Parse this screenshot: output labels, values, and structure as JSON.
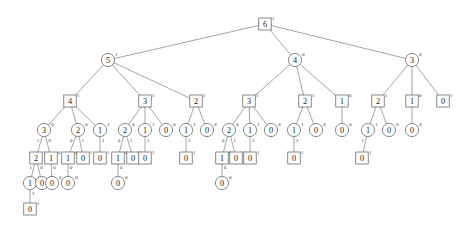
{
  "header": {
    "watermark": ""
  },
  "diagram": {
    "type": "tree",
    "shapes": {
      "square": "square-node",
      "circle": "circle-node"
    },
    "colors": {
      "stroke": "#4a4a4a",
      "fill": "#ffffff",
      "text": "#1a1a1a",
      "background": "#ffffff"
    },
    "levels": [
      {
        "index": 0,
        "shape": "square",
        "y": 24
      },
      {
        "index": 1,
        "shape": "circle",
        "y": 60
      },
      {
        "index": 2,
        "shape": "square",
        "y": 101
      },
      {
        "index": 3,
        "shape": "circle",
        "y": 130
      },
      {
        "index": 4,
        "shape": "square",
        "y": 158
      },
      {
        "index": 5,
        "shape": "circle",
        "y": 183
      },
      {
        "index": 6,
        "shape": "square",
        "y": 209
      }
    ],
    "nodes": [
      {
        "id": "n0",
        "level": 0,
        "shape": "square",
        "value": "6",
        "sup": "1",
        "x": 265,
        "y": 24
      },
      {
        "id": "n1",
        "level": 1,
        "shape": "circle",
        "value": "5",
        "sup": "1",
        "x": 108,
        "y": 60
      },
      {
        "id": "n2",
        "level": 1,
        "shape": "circle",
        "value": "4",
        "sup": "0",
        "x": 295,
        "y": 60
      },
      {
        "id": "n3",
        "level": 1,
        "shape": "circle",
        "value": "3",
        "sup": "0",
        "x": 412,
        "y": 60
      },
      {
        "id": "n4",
        "level": 2,
        "shape": "square",
        "value": "4",
        "sup": "1",
        "x": 70,
        "y": 101
      },
      {
        "id": "n5",
        "level": 2,
        "shape": "square",
        "value": "3",
        "sup": "1",
        "x": 145,
        "y": 101
      },
      {
        "id": "n6",
        "level": 2,
        "shape": "square",
        "value": "2",
        "sup": "1",
        "x": 196,
        "y": 101
      },
      {
        "id": "n7",
        "level": 2,
        "shape": "square",
        "value": "3",
        "sup": "1",
        "x": 249,
        "y": 101
      },
      {
        "id": "n8",
        "level": 2,
        "shape": "square",
        "value": "2",
        "sup": "1",
        "x": 305,
        "y": 101
      },
      {
        "id": "n9",
        "level": 2,
        "shape": "square",
        "value": "1",
        "sup": "0",
        "x": 342,
        "y": 101
      },
      {
        "id": "n10",
        "level": 2,
        "shape": "square",
        "value": "2",
        "sup": "1",
        "x": 378,
        "y": 101
      },
      {
        "id": "n11",
        "level": 2,
        "shape": "square",
        "value": "1",
        "sup": "0",
        "x": 412,
        "y": 101
      },
      {
        "id": "n12",
        "level": 2,
        "shape": "square",
        "value": "0",
        "sup": "1",
        "x": 443,
        "y": 101
      },
      {
        "id": "m0",
        "level": 3,
        "shape": "circle",
        "value": "3",
        "sup": "0",
        "x": 44,
        "y": 130
      },
      {
        "id": "m1",
        "level": 3,
        "shape": "circle",
        "value": "2",
        "sup": "0",
        "x": 78,
        "y": 130
      },
      {
        "id": "m2",
        "level": 3,
        "shape": "circle",
        "value": "1",
        "sup": "1",
        "x": 100,
        "y": 130
      },
      {
        "id": "m3",
        "level": 3,
        "shape": "circle",
        "value": "2",
        "sup": "0",
        "x": 125,
        "y": 130
      },
      {
        "id": "m4",
        "level": 3,
        "shape": "circle",
        "value": "1",
        "sup": "1",
        "x": 145,
        "y": 130
      },
      {
        "id": "m5",
        "level": 3,
        "shape": "circle",
        "value": "0",
        "sup": "0",
        "x": 166,
        "y": 130
      },
      {
        "id": "m6",
        "level": 3,
        "shape": "circle",
        "value": "1",
        "sup": "1",
        "x": 186,
        "y": 130
      },
      {
        "id": "m7",
        "level": 3,
        "shape": "circle",
        "value": "0",
        "sup": "0",
        "x": 207,
        "y": 130
      },
      {
        "id": "m8",
        "level": 3,
        "shape": "circle",
        "value": "2",
        "sup": "0",
        "x": 229,
        "y": 130
      },
      {
        "id": "m9",
        "level": 3,
        "shape": "circle",
        "value": "1",
        "sup": "1",
        "x": 250,
        "y": 130
      },
      {
        "id": "m10",
        "level": 3,
        "shape": "circle",
        "value": "0",
        "sup": "0",
        "x": 271,
        "y": 130
      },
      {
        "id": "m11",
        "level": 3,
        "shape": "circle",
        "value": "1",
        "sup": "1",
        "x": 294,
        "y": 130
      },
      {
        "id": "m12",
        "level": 3,
        "shape": "circle",
        "value": "0",
        "sup": "0",
        "x": 316,
        "y": 130
      },
      {
        "id": "m13",
        "level": 3,
        "shape": "circle",
        "value": "0",
        "sup": "0",
        "x": 342,
        "y": 130
      },
      {
        "id": "m14",
        "level": 3,
        "shape": "circle",
        "value": "1",
        "sup": "1",
        "x": 368,
        "y": 130
      },
      {
        "id": "m15",
        "level": 3,
        "shape": "circle",
        "value": "0",
        "sup": "0",
        "x": 389,
        "y": 130
      },
      {
        "id": "m16",
        "level": 3,
        "shape": "circle",
        "value": "0",
        "sup": "0",
        "x": 412,
        "y": 130
      },
      {
        "id": "k0",
        "level": 4,
        "shape": "square",
        "value": "2",
        "sup": "1",
        "x": 36,
        "y": 158
      },
      {
        "id": "k1",
        "level": 4,
        "shape": "square",
        "value": "1",
        "sup": "0",
        "x": 51,
        "y": 158
      },
      {
        "id": "k2",
        "level": 4,
        "shape": "square",
        "value": "1",
        "sup": "0",
        "x": 68,
        "y": 158
      },
      {
        "id": "k3",
        "level": 4,
        "shape": "square",
        "value": "0",
        "sup": "1",
        "x": 83,
        "y": 158
      },
      {
        "id": "k4",
        "level": 4,
        "shape": "square",
        "value": "0",
        "sup": "1",
        "x": 100,
        "y": 158
      },
      {
        "id": "k5",
        "level": 4,
        "shape": "square",
        "value": "1",
        "sup": "0",
        "x": 118,
        "y": 158
      },
      {
        "id": "k6",
        "level": 4,
        "shape": "square",
        "value": "0",
        "sup": "1",
        "x": 133,
        "y": 158
      },
      {
        "id": "k7",
        "level": 4,
        "shape": "square",
        "value": "0",
        "sup": "1",
        "x": 145,
        "y": 158
      },
      {
        "id": "k8",
        "level": 4,
        "shape": "square",
        "value": "0",
        "sup": "1",
        "x": 186,
        "y": 158
      },
      {
        "id": "k9",
        "level": 4,
        "shape": "square",
        "value": "1",
        "sup": "0",
        "x": 222,
        "y": 158
      },
      {
        "id": "k10",
        "level": 4,
        "shape": "square",
        "value": "0",
        "sup": "1",
        "x": 236,
        "y": 158
      },
      {
        "id": "k11",
        "level": 4,
        "shape": "square",
        "value": "0",
        "sup": "1",
        "x": 250,
        "y": 158
      },
      {
        "id": "k12",
        "level": 4,
        "shape": "square",
        "value": "0",
        "sup": "1",
        "x": 294,
        "y": 158
      },
      {
        "id": "k13",
        "level": 4,
        "shape": "square",
        "value": "0",
        "sup": "1",
        "x": 362,
        "y": 158
      },
      {
        "id": "j0",
        "level": 5,
        "shape": "circle",
        "value": "1",
        "sup": "1",
        "x": 30,
        "y": 183
      },
      {
        "id": "j1",
        "level": 5,
        "shape": "circle",
        "value": "0",
        "sup": "0",
        "x": 42,
        "y": 183
      },
      {
        "id": "j2",
        "level": 5,
        "shape": "circle",
        "value": "0",
        "sup": "0",
        "x": 52,
        "y": 183
      },
      {
        "id": "j3",
        "level": 5,
        "shape": "circle",
        "value": "0",
        "sup": "0",
        "x": 68,
        "y": 183
      },
      {
        "id": "j4",
        "level": 5,
        "shape": "circle",
        "value": "0",
        "sup": "0",
        "x": 118,
        "y": 183
      },
      {
        "id": "j5",
        "level": 5,
        "shape": "circle",
        "value": "0",
        "sup": "0",
        "x": 222,
        "y": 183
      },
      {
        "id": "b0",
        "level": 6,
        "shape": "square",
        "value": "0",
        "sup": "1",
        "x": 30,
        "y": 209
      }
    ],
    "edges": [
      {
        "from": "n0",
        "to": "n1",
        "label": ""
      },
      {
        "from": "n0",
        "to": "n2",
        "label": ""
      },
      {
        "from": "n0",
        "to": "n3",
        "label": ""
      },
      {
        "from": "n1",
        "to": "n4",
        "label": ""
      },
      {
        "from": "n1",
        "to": "n5",
        "label": ""
      },
      {
        "from": "n1",
        "to": "n6",
        "label": ""
      },
      {
        "from": "n2",
        "to": "n7",
        "label": ""
      },
      {
        "from": "n2",
        "to": "n8",
        "label": ""
      },
      {
        "from": "n2",
        "to": "n9",
        "label": ""
      },
      {
        "from": "n3",
        "to": "n10",
        "label": ""
      },
      {
        "from": "n3",
        "to": "n11",
        "label": ""
      },
      {
        "from": "n3",
        "to": "n12",
        "label": ""
      },
      {
        "from": "n4",
        "to": "m0",
        "label": ""
      },
      {
        "from": "n4",
        "to": "m1",
        "label": ""
      },
      {
        "from": "n4",
        "to": "m2",
        "label": ""
      },
      {
        "from": "n5",
        "to": "m3",
        "label": ""
      },
      {
        "from": "n5",
        "to": "m4",
        "label": ""
      },
      {
        "from": "n5",
        "to": "m5",
        "label": ""
      },
      {
        "from": "n6",
        "to": "m6",
        "label": ""
      },
      {
        "from": "n6",
        "to": "m7",
        "label": ""
      },
      {
        "from": "n7",
        "to": "m8",
        "label": ""
      },
      {
        "from": "n7",
        "to": "m9",
        "label": ""
      },
      {
        "from": "n7",
        "to": "m10",
        "label": ""
      },
      {
        "from": "n8",
        "to": "m11",
        "label": ""
      },
      {
        "from": "n8",
        "to": "m12",
        "label": ""
      },
      {
        "from": "n9",
        "to": "m13",
        "label": ""
      },
      {
        "from": "n10",
        "to": "m14",
        "label": ""
      },
      {
        "from": "n10",
        "to": "m15",
        "label": ""
      },
      {
        "from": "n11",
        "to": "m16",
        "label": ""
      },
      {
        "from": "m0",
        "to": "k0",
        "label": "1"
      },
      {
        "from": "m0",
        "to": "k1",
        "label": "0"
      },
      {
        "from": "m1",
        "to": "k2",
        "label": "0"
      },
      {
        "from": "m1",
        "to": "k3",
        "label": "1"
      },
      {
        "from": "m2",
        "to": "k4",
        "label": "1"
      },
      {
        "from": "m3",
        "to": "k5",
        "label": "0"
      },
      {
        "from": "m3",
        "to": "k6",
        "label": "1"
      },
      {
        "from": "m4",
        "to": "k7",
        "label": "1"
      },
      {
        "from": "m6",
        "to": "k8",
        "label": "1"
      },
      {
        "from": "m8",
        "to": "k9",
        "label": "0"
      },
      {
        "from": "m8",
        "to": "k10",
        "label": "1"
      },
      {
        "from": "m9",
        "to": "k11",
        "label": "1"
      },
      {
        "from": "m11",
        "to": "k12",
        "label": "1"
      },
      {
        "from": "m14",
        "to": "k13",
        "label": "1"
      },
      {
        "from": "k0",
        "to": "j0",
        "label": "1"
      },
      {
        "from": "k0",
        "to": "j1",
        "label": "0"
      },
      {
        "from": "k1",
        "to": "j2",
        "label": "0"
      },
      {
        "from": "k2",
        "to": "j3",
        "label": "0"
      },
      {
        "from": "k5",
        "to": "j4",
        "label": "0"
      },
      {
        "from": "k9",
        "to": "j5",
        "label": "0"
      },
      {
        "from": "j0",
        "to": "b0",
        "label": "1"
      }
    ]
  }
}
